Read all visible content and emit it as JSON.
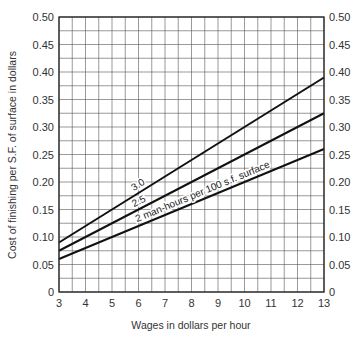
{
  "chart_data": {
    "type": "line",
    "title": "",
    "xlabel": "Wages in dollars per hour",
    "ylabel": "Cost of finishing per S.F. of surface in dollars",
    "xlim": [
      3,
      13
    ],
    "ylim": [
      0,
      0.5
    ],
    "x_ticks": [
      "3",
      "4",
      "5",
      "6",
      "7",
      "8",
      "9",
      "10",
      "11",
      "12",
      "13"
    ],
    "y_ticks": [
      "0",
      "0.05",
      "0.10",
      "0.15",
      "0.20",
      "0.25",
      "0.30",
      "0.35",
      "0.40",
      "0.45",
      "0.50"
    ],
    "y_ticks_right": [
      "0",
      "0.05",
      "0.10",
      "0.15",
      "0.20",
      "0.25",
      "0.30",
      "0.35",
      "0.40",
      "0.45",
      "0.50"
    ],
    "grid": true,
    "grid_minor_x_step": 0.5,
    "grid_minor_y_step": 0.025,
    "x": [
      3,
      13
    ],
    "series": [
      {
        "name": "3.0",
        "label": "3.0",
        "values": [
          0.09,
          0.39
        ]
      },
      {
        "name": "2.5",
        "label": "2.5",
        "values": [
          0.075,
          0.325
        ]
      },
      {
        "name": "2",
        "label": "2 man-hours per 100 s.f. surface",
        "values": [
          0.06,
          0.26
        ]
      }
    ],
    "legend": "inline labels on lines"
  }
}
